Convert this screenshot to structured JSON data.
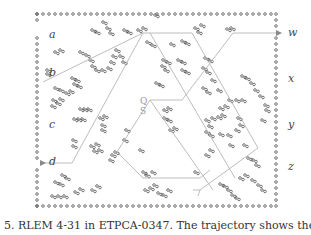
{
  "figure": {
    "port_labels_left": [
      "a",
      "b",
      "c",
      "d"
    ],
    "port_labels_right": [
      "w",
      "x",
      "y",
      "z"
    ],
    "center_labels": [
      "Q",
      "S"
    ],
    "dot_color": "#555555",
    "trajectory_color": "#b0b0b0"
  },
  "caption": {
    "text": "5.    RLEM 4-31 in ETPCA-0347.  The trajectory shows the case"
  }
}
